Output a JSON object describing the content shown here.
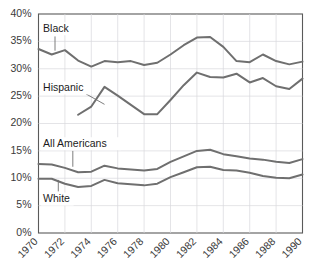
{
  "chart_data": {
    "type": "line",
    "title": "",
    "xlabel": "",
    "ylabel": "",
    "grid": true,
    "legend_position": "inline-annotations",
    "xlim": [
      1970,
      1990
    ],
    "ylim": [
      0,
      40
    ],
    "x": [
      1970,
      1971,
      1972,
      1973,
      1974,
      1975,
      1976,
      1977,
      1978,
      1979,
      1980,
      1981,
      1982,
      1983,
      1984,
      1985,
      1986,
      1987,
      1988,
      1989,
      1990
    ],
    "xticks": [
      "1970",
      "1972",
      "1974",
      "1976",
      "1978",
      "1980",
      "1982",
      "1984",
      "1986",
      "1988",
      "1990"
    ],
    "yticks": [
      "0%",
      "5%",
      "10%",
      "15%",
      "20%",
      "25%",
      "30%",
      "35%",
      "40%"
    ],
    "ytick_values": [
      0,
      5,
      10,
      15,
      20,
      25,
      30,
      35,
      40
    ],
    "series": [
      {
        "name": "Black",
        "color": "#6f6f6f",
        "x": [
          1970,
          1971,
          1972,
          1973,
          1974,
          1975,
          1976,
          1977,
          1978,
          1979,
          1980,
          1981,
          1982,
          1983,
          1984,
          1985,
          1986,
          1987,
          1988,
          1989,
          1990
        ],
        "values": [
          33.6,
          32.6,
          33.4,
          31.5,
          30.4,
          31.4,
          31.2,
          31.4,
          30.7,
          31.1,
          32.6,
          34.3,
          35.7,
          35.8,
          34.0,
          31.4,
          31.2,
          32.6,
          31.4,
          30.8,
          31.3
        ]
      },
      {
        "name": "Hispanic",
        "color": "#6f6f6f",
        "x": [
          1973,
          1974,
          1975,
          1976,
          1977,
          1978,
          1979,
          1980,
          1981,
          1982,
          1983,
          1984,
          1985,
          1986,
          1987,
          1988,
          1989,
          1990
        ],
        "values": [
          21.6,
          23.1,
          26.7,
          25.1,
          23.4,
          21.7,
          21.7,
          24.3,
          27.0,
          29.3,
          28.5,
          28.4,
          29.1,
          27.5,
          28.3,
          26.8,
          26.3,
          28.2
        ]
      },
      {
        "name": "All Americans",
        "color": "#6f6f6f",
        "x": [
          1970,
          1971,
          1972,
          1973,
          1974,
          1975,
          1976,
          1977,
          1978,
          1979,
          1980,
          1981,
          1982,
          1983,
          1984,
          1985,
          1986,
          1987,
          1988,
          1989,
          1990
        ],
        "values": [
          12.6,
          12.5,
          11.9,
          11.1,
          11.2,
          12.3,
          11.8,
          11.6,
          11.4,
          11.7,
          13.0,
          14.0,
          15.0,
          15.2,
          14.4,
          14.0,
          13.6,
          13.4,
          13.0,
          12.8,
          13.5
        ]
      },
      {
        "name": "White",
        "color": "#6f6f6f",
        "x": [
          1970,
          1971,
          1972,
          1973,
          1974,
          1975,
          1976,
          1977,
          1978,
          1979,
          1980,
          1981,
          1982,
          1983,
          1984,
          1985,
          1986,
          1987,
          1988,
          1989,
          1990
        ],
        "values": [
          9.9,
          9.9,
          9.0,
          8.4,
          8.6,
          9.7,
          9.1,
          8.9,
          8.7,
          9.0,
          10.2,
          11.1,
          12.0,
          12.1,
          11.5,
          11.4,
          11.0,
          10.4,
          10.1,
          10.0,
          10.7
        ]
      }
    ],
    "annotations": [
      {
        "text": "Black",
        "x": 1970.35,
        "y": 37.3
      },
      {
        "text": "Hispanic",
        "x": 1970.35,
        "y": 26.5
      },
      {
        "text": "All Americans",
        "x": 1970.35,
        "y": 16.3
      },
      {
        "text": "White",
        "x": 1970.35,
        "y": 6.2
      }
    ]
  }
}
